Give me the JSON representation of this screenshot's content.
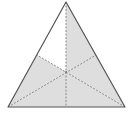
{
  "diagram": {
    "type": "equilateral-triangle-medians",
    "vertices": {
      "apex": [
        66,
        2
      ],
      "bottom_left": [
        8,
        107
      ],
      "bottom_right": [
        125,
        107
      ]
    },
    "midpoints": {
      "left_side": [
        37,
        55
      ],
      "right_side": [
        96,
        55
      ],
      "base": [
        66,
        107
      ]
    },
    "centroid": [
      66,
      72
    ],
    "regions_total": 6,
    "regions_shaded": 5,
    "regions_unshaded": 1,
    "colors": {
      "shade": "#dedede",
      "outline": "#555555",
      "median": "#8a8a8a",
      "background": "#ffffff"
    }
  }
}
